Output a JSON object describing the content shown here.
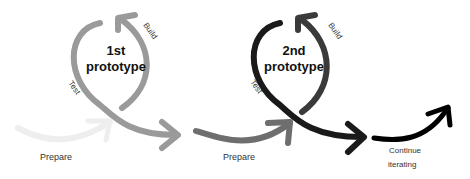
{
  "diagram": {
    "stages": [
      {
        "prepare_label": "Prepare",
        "title_line1": "1st",
        "title_line2": "prototype",
        "build_label": "Build",
        "test_label": "Test",
        "color_prepare": "#eeeeee",
        "color_loop": "#9a9a9a"
      },
      {
        "prepare_label": "Prepare",
        "title_line1": "2nd",
        "title_line2": "prototype",
        "build_label": "Build",
        "test_label": "Test",
        "color_prepare": "#6e6e6e",
        "color_loop": "#1a1a1a"
      }
    ],
    "continue_line1": "Continue",
    "continue_line2": "iterating",
    "color_continue": "#000000"
  }
}
